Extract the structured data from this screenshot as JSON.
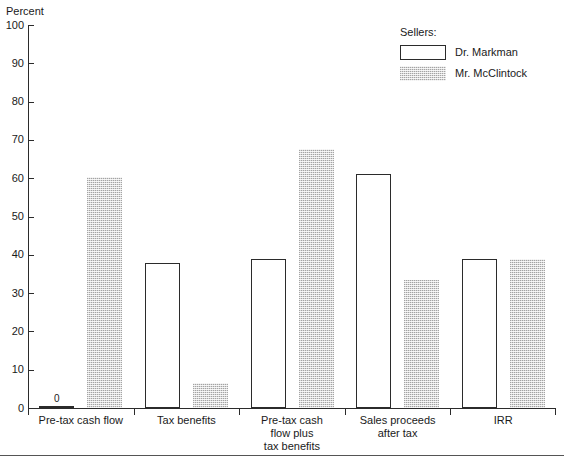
{
  "chart_data": {
    "type": "bar",
    "title": "",
    "ylabel": "Percent",
    "xlabel": "",
    "ylim": [
      0,
      100
    ],
    "ytick_step": 10,
    "ytick_labels": [
      "100",
      "90",
      "80",
      "70",
      "60",
      "50",
      "40",
      "30",
      "20",
      "10",
      "0"
    ],
    "grid": false,
    "legend_position": "top-right",
    "legend_title": "Sellers:",
    "categories": [
      "Pre-tax cash flow",
      "Tax benefits",
      "Pre-tax cash flow plus tax benefits",
      "Sales proceeds after tax",
      "IRR"
    ],
    "category_label_lines": [
      [
        "Pre-tax cash flow"
      ],
      [
        "Tax benefits"
      ],
      [
        "Pre-tax cash",
        "flow plus",
        "tax benefits"
      ],
      [
        "Sales proceeds",
        "after tax"
      ],
      [
        "IRR"
      ]
    ],
    "series": [
      {
        "name": "Dr. Markman",
        "style": "outline",
        "color": "#ffffff",
        "edge_color": "#2b2b2b",
        "values": [
          0,
          37.8,
          39,
          61.2,
          39
        ],
        "point_labels": [
          "0",
          "",
          "",
          "",
          ""
        ]
      },
      {
        "name": "Mr. McClintock",
        "style": "hatched",
        "color": "#d9d9d9",
        "edge_color": "#a8a8a8",
        "values": [
          60.3,
          6.5,
          67.7,
          33.4,
          39
        ],
        "point_labels": [
          "",
          "",
          "",
          "",
          ""
        ]
      }
    ]
  },
  "legend": {
    "title": "Sellers:",
    "entries": [
      {
        "label": "Dr. Markman",
        "swatch": "outline-bar-swatch"
      },
      {
        "label": "Mr. McClintock",
        "swatch": "hatched-bar-swatch"
      }
    ]
  },
  "axes": {
    "y_title": "Percent"
  }
}
